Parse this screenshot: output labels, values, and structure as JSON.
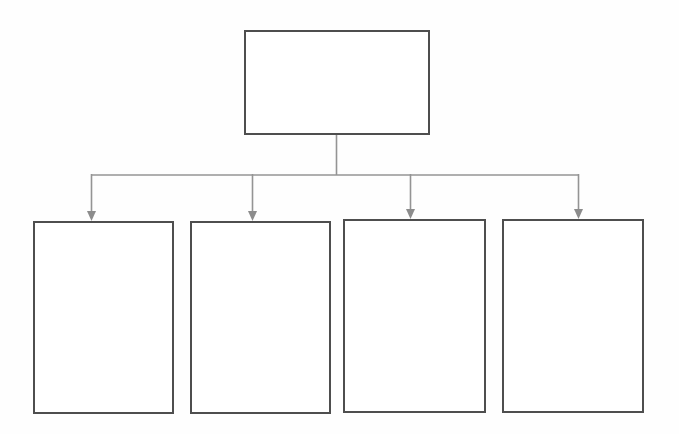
{
  "diagram": {
    "type": "hierarchy",
    "root": {
      "label": ""
    },
    "children": [
      {
        "label": ""
      },
      {
        "label": ""
      },
      {
        "label": ""
      },
      {
        "label": ""
      }
    ],
    "colors": {
      "background": "#fefefe",
      "box_fill": "#ffffff",
      "box_border": "#4e4e4e",
      "connector_line": "#949494",
      "arrowhead": "#8c8c8c"
    }
  }
}
